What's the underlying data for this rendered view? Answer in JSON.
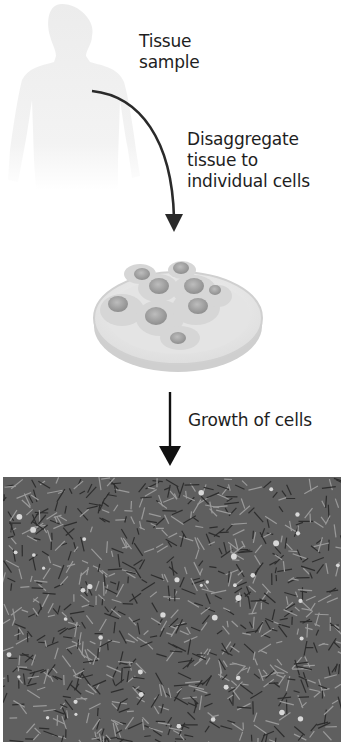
{
  "diagram": {
    "steps": [
      {
        "label_lines": [
          "Tissue",
          "sample"
        ]
      },
      {
        "label_lines": [
          "Disaggregate",
          "tissue to",
          "individual cells"
        ]
      },
      {
        "label_lines": [
          "Growth of cells"
        ]
      }
    ],
    "images": {
      "body": "human-silhouette",
      "dish": "petri-dish-with-cells",
      "micrograph": "cultured-cells-micrograph"
    },
    "colors": {
      "arrow": "#2a2a2a",
      "silhouette": "#f2f2f2",
      "micrograph_bg": "#5f5f5f"
    }
  }
}
